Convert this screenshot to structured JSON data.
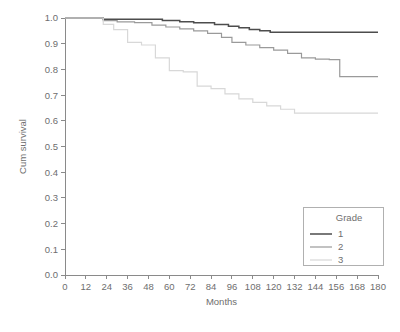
{
  "chart_data": {
    "type": "line",
    "title": "",
    "subtitle": "",
    "xlabel": "Months",
    "ylabel": "Cum survival",
    "xlim": [
      0,
      180
    ],
    "ylim": [
      0.0,
      1.0
    ],
    "xticks": [
      0,
      12,
      24,
      36,
      48,
      60,
      72,
      84,
      96,
      108,
      120,
      132,
      144,
      156,
      168,
      180
    ],
    "xtick_labels": [
      "0",
      "12",
      "24",
      "36",
      "48",
      "60",
      "72",
      "84",
      "96",
      "108",
      "120",
      "132",
      "144",
      "156",
      "168",
      "180"
    ],
    "yticks": [
      0.0,
      0.1,
      0.2,
      0.3,
      0.4,
      0.5,
      0.6,
      0.7,
      0.8,
      0.9,
      1.0
    ],
    "ytick_labels": [
      "0.0",
      "0.1",
      "0.2",
      "0.3",
      "0.4",
      "0.5",
      "0.6",
      "0.7",
      "0.8",
      "0.9",
      "1.0"
    ],
    "grid": false,
    "legend_position": "bottom-right",
    "legend_title": "Grade",
    "step_type": "post",
    "series": [
      {
        "name": "1",
        "label": "1",
        "color": "#4d4d4d",
        "width": 1.5,
        "x": [
          0,
          10,
          22,
          56,
          66,
          74,
          86,
          94,
          100,
          106,
          112,
          118,
          180
        ],
        "y": [
          1.0,
          1.0,
          0.995,
          0.99,
          0.985,
          0.982,
          0.975,
          0.968,
          0.962,
          0.955,
          0.95,
          0.945,
          0.945
        ]
      },
      {
        "name": "2",
        "label": "2",
        "color": "#9a9a9a",
        "width": 1.2,
        "x": [
          0,
          12,
          22,
          30,
          40,
          50,
          58,
          66,
          74,
          82,
          90,
          96,
          104,
          112,
          120,
          128,
          136,
          144,
          152,
          158,
          180
        ],
        "y": [
          1.0,
          1.0,
          0.99,
          0.985,
          0.982,
          0.972,
          0.965,
          0.958,
          0.95,
          0.94,
          0.925,
          0.905,
          0.895,
          0.885,
          0.875,
          0.862,
          0.845,
          0.84,
          0.838,
          0.772,
          0.772
        ]
      },
      {
        "name": "3",
        "label": "3",
        "color": "#d8d8d8",
        "width": 1.2,
        "x": [
          0,
          14,
          22,
          28,
          36,
          44,
          52,
          60,
          68,
          76,
          84,
          92,
          100,
          108,
          116,
          124,
          132,
          180
        ],
        "y": [
          1.0,
          1.0,
          0.975,
          0.955,
          0.905,
          0.895,
          0.845,
          0.795,
          0.79,
          0.735,
          0.725,
          0.705,
          0.685,
          0.672,
          0.658,
          0.645,
          0.63,
          0.63
        ]
      }
    ]
  },
  "plot_geometry": {
    "left": 65,
    "right": 378,
    "top": 18,
    "bottom": 275
  },
  "legend_geometry": {
    "x": 303,
    "y": 207,
    "width": 80,
    "height": 58
  }
}
